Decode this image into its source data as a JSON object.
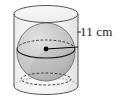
{
  "figure": {
    "type": "geometry-solid-diagram",
    "background_color": "#ffffff",
    "shapes": {
      "cylinder": {
        "name": "cylinder",
        "fill_color": "#f2f2f2",
        "stroke_color": "#555555",
        "top_ellipse": {
          "cx": 46,
          "cy": 14,
          "rx": 32,
          "ry": 8.5
        },
        "bottom_ellipse": {
          "cx": 46,
          "cy": 86,
          "rx": 32,
          "ry": 8.5
        },
        "left_x": 14,
        "right_x": 78
      },
      "sphere": {
        "name": "sphere",
        "fill_color": "#c2c2c2",
        "highlight_color": "#dedede",
        "shadow_color": "#a6a6a6",
        "stroke_color": "#5a5a5a",
        "cx": 46,
        "cy": 52,
        "r": 29
      },
      "equator_ellipse": {
        "name": "equator",
        "cx": 46,
        "cy": 49,
        "rx": 29,
        "ry": 9,
        "front_style": "solid",
        "back_style": "dashed",
        "stroke_color": "#3a3a3a"
      },
      "lower_hidden_ellipse": {
        "name": "hidden-base-circle",
        "cx": 46,
        "cy": 79,
        "rx": 25,
        "ry": 6,
        "style": "dashed",
        "stroke_color": "#3a3a3a"
      },
      "center_point": {
        "name": "center-point",
        "cx": 46,
        "cy": 49,
        "r": 2.3,
        "color": "#000000"
      },
      "radius_line": {
        "name": "radius-segment",
        "x1": 46,
        "y1": 49,
        "x2": 78,
        "y2": 47,
        "color": "#000000"
      },
      "leader_tick": {
        "name": "leader-tick",
        "x1": 78,
        "y1": 32,
        "x2": 81,
        "y2": 32,
        "color": "#1a1a1a"
      }
    }
  },
  "labels": {
    "radius_measure": "11 cm"
  }
}
